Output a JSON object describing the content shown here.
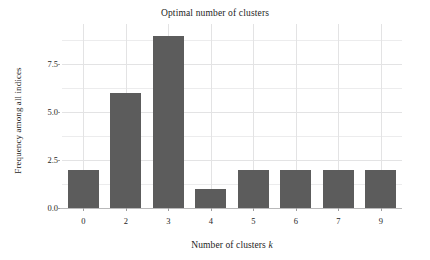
{
  "chart_data": {
    "type": "bar",
    "title": "Optimal number of clusters",
    "xlabel_prefix": "Number of clusters ",
    "xlabel_italic": "k",
    "xlabel": "Number of clusters k",
    "ylabel": "Frequency among all indices",
    "categories": [
      "0",
      "2",
      "3",
      "4",
      "5",
      "6",
      "7",
      "9"
    ],
    "values": [
      2,
      6,
      9,
      1,
      2,
      2,
      2,
      2
    ],
    "yticks": [
      "0.0",
      "2.5",
      "5.0",
      "7.5"
    ],
    "ytick_values": [
      0.0,
      2.5,
      5.0,
      7.5
    ],
    "minor_ytick_values": [
      1.25,
      3.75,
      6.25,
      8.75
    ],
    "ylim": [
      0,
      9.6
    ],
    "grid": true,
    "legend": "none",
    "bar_color": "#5c5c5c",
    "grid_color": "#ececed",
    "background_color": "#ffffff",
    "text_color": "#1c1c1c"
  }
}
